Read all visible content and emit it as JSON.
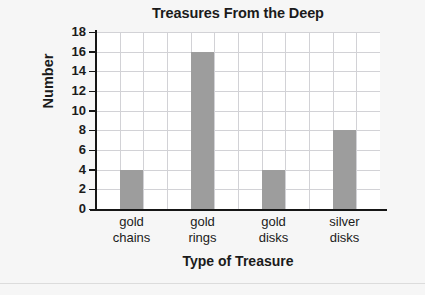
{
  "chart_data": {
    "type": "bar",
    "title": "Treasures From the Deep",
    "xlabel": "Type of Treasure",
    "ylabel": "Number",
    "categories": [
      "gold chains",
      "gold rings",
      "gold disks",
      "silver disks"
    ],
    "category_lines": [
      [
        "gold",
        "chains"
      ],
      [
        "gold",
        "rings"
      ],
      [
        "gold",
        "disks"
      ],
      [
        "silver",
        "disks"
      ]
    ],
    "values": [
      4,
      16,
      4,
      8
    ],
    "ylim": [
      0,
      18
    ],
    "ytick_step": 2,
    "ytick_labels": [
      "18",
      "16",
      "14",
      "12",
      "10",
      "8",
      "6",
      "4",
      "2",
      "0"
    ],
    "ytick_values": [
      18,
      16,
      14,
      12,
      10,
      8,
      6,
      4,
      2,
      0
    ],
    "grid": true,
    "grid_columns": 12,
    "legend": null,
    "bar_color": "#9d9d9d",
    "grid_color": "#d2d2d6",
    "axis_color": "#161616",
    "plot_background": "#ffffff",
    "page_background": "#f6f6f6"
  }
}
